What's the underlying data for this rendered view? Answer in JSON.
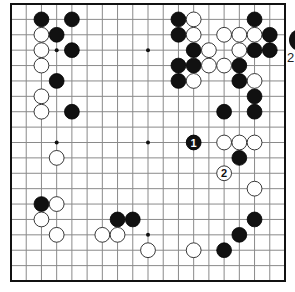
{
  "board": {
    "size": 19,
    "origin_x": 11,
    "origin_y": 4,
    "width": 274,
    "height": 277,
    "line_color": "#8a8a8a",
    "edge_color": "#111111",
    "background": "#ffffff",
    "hoshi": [
      [
        3,
        3
      ],
      [
        9,
        3
      ],
      [
        15,
        3
      ],
      [
        3,
        9
      ],
      [
        9,
        9
      ],
      [
        15,
        9
      ],
      [
        3,
        15
      ],
      [
        9,
        15
      ],
      [
        15,
        15
      ]
    ],
    "stone_radius": 7.4
  },
  "stones": {
    "black": [
      [
        2,
        1
      ],
      [
        4,
        1
      ],
      [
        3,
        2
      ],
      [
        4,
        3
      ],
      [
        3,
        5
      ],
      [
        4,
        7
      ],
      [
        11,
        1
      ],
      [
        16,
        1
      ],
      [
        11,
        2
      ],
      [
        17,
        2
      ],
      [
        12,
        3
      ],
      [
        16,
        3
      ],
      [
        17,
        3
      ],
      [
        11,
        4
      ],
      [
        12,
        4
      ],
      [
        15,
        4
      ],
      [
        11,
        5
      ],
      [
        15,
        5
      ],
      [
        16,
        6
      ],
      [
        14,
        7
      ],
      [
        16,
        7
      ],
      [
        15,
        10
      ],
      [
        2,
        13
      ],
      [
        7,
        14
      ],
      [
        8,
        14
      ],
      [
        16,
        14
      ],
      [
        15,
        15
      ],
      [
        14,
        16
      ]
    ],
    "white": [
      [
        2,
        2
      ],
      [
        2,
        3
      ],
      [
        2,
        4
      ],
      [
        2,
        6
      ],
      [
        2,
        7
      ],
      [
        12,
        1
      ],
      [
        12,
        2
      ],
      [
        14,
        2
      ],
      [
        15,
        2
      ],
      [
        16,
        2
      ],
      [
        13,
        3
      ],
      [
        15,
        3
      ],
      [
        13,
        4
      ],
      [
        14,
        4
      ],
      [
        12,
        5
      ],
      [
        16,
        5
      ],
      [
        14,
        9
      ],
      [
        15,
        9
      ],
      [
        16,
        9
      ],
      [
        3,
        10
      ],
      [
        16,
        12
      ],
      [
        3,
        13
      ],
      [
        2,
        14
      ],
      [
        3,
        15
      ],
      [
        6,
        15
      ],
      [
        7,
        15
      ],
      [
        9,
        16
      ],
      [
        12,
        16
      ]
    ]
  },
  "numbered_moves": [
    {
      "number": "1",
      "color": "black",
      "col": 12,
      "row": 9
    },
    {
      "number": "2",
      "color": "white",
      "col": 14,
      "row": 11
    }
  ],
  "outside": {
    "partial_stone_color": "black",
    "label": "2"
  }
}
